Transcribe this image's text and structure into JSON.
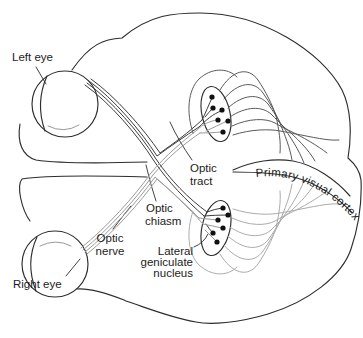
{
  "figure": {
    "labels": {
      "left_eye": "Left eye",
      "right_eye": "Right eye",
      "optic_nerve": [
        "Optic",
        "nerve"
      ],
      "optic_chiasm": [
        "Optic",
        "chiasm"
      ],
      "optic_tract": [
        "Optic",
        "tract"
      ],
      "lateral_geniculate_nucleus": [
        "Lateral",
        "geniculate",
        "nucleus"
      ],
      "primary_visual_cortex": "Primary visual cortex"
    },
    "colors": {
      "outline": "#2e2e2e",
      "left_eye_fibers": "#3d3d3d",
      "right_eye_fibers": "#9b9b9b",
      "upper_radiation": "#5a5a5a",
      "lower_radiation": "#ababab",
      "dots": "#111111",
      "text": "#1c1c1c",
      "background": "#ffffff"
    }
  }
}
